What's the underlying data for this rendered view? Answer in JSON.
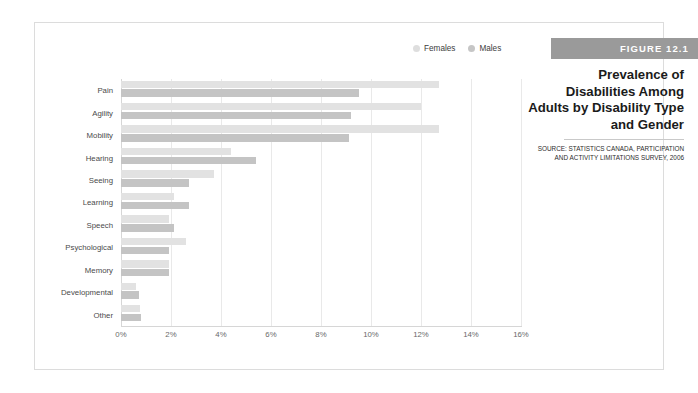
{
  "figure": {
    "banner": "FIGURE 12.1",
    "title": "Prevalence of Disabilities Among Adults by Disability Type and Gender",
    "source": "SOURCE: STATISTICS CANADA, PARTICIPATION AND ACTIVITY LIMITATIONS SURVEY, 2006"
  },
  "colors": {
    "females": "#e2e2e2",
    "males": "#c4c4c4",
    "banner": "#9a9a9a",
    "grid": "#e9e9e9",
    "frame": "#dcdcdc",
    "text": "#4a4a4a"
  },
  "legend": {
    "position": "top-right",
    "items": [
      {
        "label": "Females",
        "color": "#dedede"
      },
      {
        "label": "Males",
        "color": "#c6c6c6"
      }
    ]
  },
  "chart_data": {
    "type": "bar",
    "orientation": "horizontal",
    "title": "Prevalence of Disabilities Among Adults by Disability Type and Gender",
    "xlabel": "",
    "ylabel": "",
    "xlim": [
      0,
      16
    ],
    "xticks": [
      "0%",
      "2%",
      "4%",
      "6%",
      "8%",
      "10%",
      "12%",
      "14%",
      "16%"
    ],
    "xtick_values": [
      0,
      2,
      4,
      6,
      8,
      10,
      12,
      14,
      16
    ],
    "grid": true,
    "categories": [
      "Pain",
      "Agility",
      "Mobility",
      "Hearing",
      "Seeing",
      "Learning",
      "Speech",
      "Psychological",
      "Memory",
      "Developmental",
      "Other"
    ],
    "series": [
      {
        "name": "Females",
        "color": "#e2e2e2",
        "values": [
          12.7,
          12.0,
          12.7,
          4.4,
          3.7,
          2.1,
          1.9,
          2.6,
          1.9,
          0.6,
          0.75
        ]
      },
      {
        "name": "Males",
        "color": "#c4c4c4",
        "values": [
          9.5,
          9.2,
          9.1,
          5.4,
          2.7,
          2.7,
          2.1,
          1.9,
          1.9,
          0.7,
          0.8
        ]
      }
    ]
  }
}
